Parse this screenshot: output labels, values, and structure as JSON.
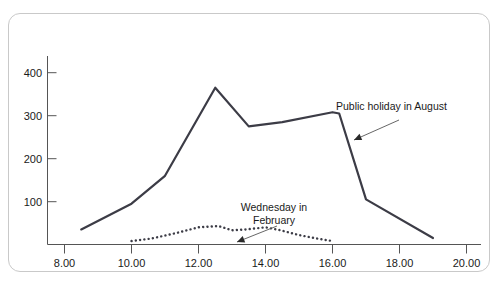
{
  "chart_data": {
    "type": "line",
    "title": "",
    "subtitle": "",
    "xlabel": "",
    "ylabel": "",
    "xlim": [
      8.0,
      20.0
    ],
    "ylim": [
      0,
      440
    ],
    "grid": false,
    "legend_position": "none",
    "x_tick_labels": [
      "8.00",
      "10.00",
      "12.00",
      "14.00",
      "16.00",
      "18.00",
      "20.00"
    ],
    "x_tick_values": [
      8,
      10,
      12,
      14,
      16,
      18,
      20
    ],
    "y_tick_labels": [
      "100",
      "200",
      "300",
      "400"
    ],
    "y_tick_values": [
      100,
      200,
      300,
      400
    ],
    "series": [
      {
        "name": "Public holiday in August",
        "style": "solid",
        "color": "#3c3c46",
        "x": [
          8.5,
          10.0,
          11.0,
          12.5,
          13.5,
          14.5,
          16.0,
          16.2,
          17.0,
          19.0
        ],
        "values": [
          35,
          95,
          160,
          365,
          275,
          285,
          308,
          305,
          105,
          15
        ]
      },
      {
        "name": "Wednesday in February",
        "style": "dotted",
        "color": "#3c3c46",
        "x": [
          10.0,
          10.6,
          11.3,
          12.0,
          12.6,
          13.0,
          13.4,
          14.0,
          14.4,
          15.0,
          15.6,
          16.0
        ],
        "values": [
          8,
          14,
          26,
          40,
          43,
          33,
          35,
          40,
          34,
          22,
          13,
          8
        ]
      }
    ],
    "annotations": [
      {
        "id": "annotation-august",
        "text": "Public holiday in August",
        "lines": [
          "Public holiday in August"
        ],
        "text_x": 327,
        "text_y": 96,
        "align": "start",
        "arrow_from": [
          390,
          106
        ],
        "arrow_to": [
          345,
          126
        ]
      },
      {
        "id": "annotation-february",
        "text": "Wednesday in February",
        "lines": [
          "Wednesday in",
          "February"
        ],
        "text_x": 265,
        "text_y": 197,
        "align": "middle",
        "arrow_from": [
          268,
          212
        ],
        "arrow_to": [
          228,
          228
        ]
      }
    ],
    "colors": {
      "line": "#3c3c46",
      "axis": "#555555",
      "text": "#1a1a1a",
      "card_border": "#c9c9c9",
      "background": "#ffffff"
    }
  }
}
